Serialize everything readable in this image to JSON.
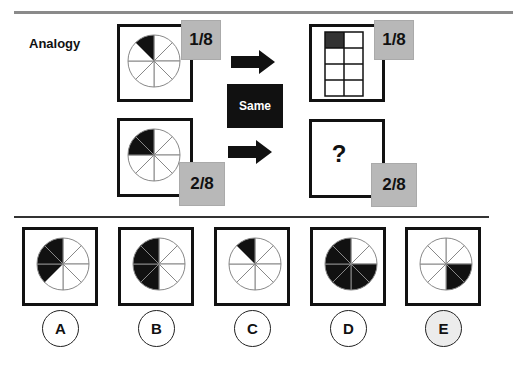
{
  "title": "Analogy",
  "relation_label": "Same",
  "question_mark": "?",
  "colors": {
    "fill": "#111111",
    "frac_bg": "#b8b8b8",
    "line": "#888888"
  },
  "stem": {
    "top_left": {
      "shape": "pie-8",
      "shaded_sectors": [
        7
      ],
      "fraction": "1/8"
    },
    "top_right": {
      "shape": "grid-2x4",
      "shaded_cells": [
        0
      ],
      "fraction": "1/8"
    },
    "bottom_left": {
      "shape": "pie-8",
      "shaded_sectors": [
        6,
        7
      ],
      "fraction": "2/8"
    },
    "bottom_right": {
      "shape": "unknown",
      "fraction": "2/8"
    }
  },
  "options": [
    {
      "label": "A",
      "shaded_sectors": [
        5,
        6,
        7
      ]
    },
    {
      "label": "B",
      "shaded_sectors": [
        4,
        5,
        6,
        7
      ]
    },
    {
      "label": "C",
      "shaded_sectors": [
        7
      ]
    },
    {
      "label": "D",
      "shaded_sectors": [
        2,
        3,
        4,
        5,
        6,
        7
      ]
    },
    {
      "label": "E",
      "shaded_sectors": [
        2,
        3
      ]
    }
  ]
}
